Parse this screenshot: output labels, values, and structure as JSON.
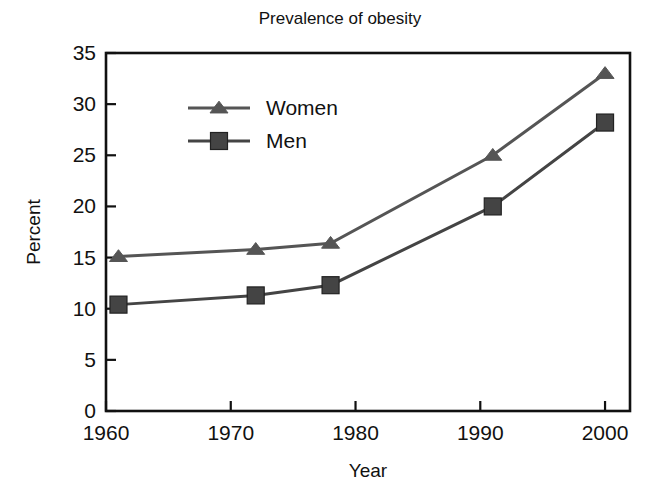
{
  "chart_data": {
    "type": "line",
    "title": "Prevalence of obesity",
    "xlabel": "Year",
    "ylabel": "Percent",
    "xlim": [
      1960,
      2002
    ],
    "ylim": [
      0,
      35
    ],
    "xticks": [
      1960,
      1970,
      1980,
      1990,
      2000
    ],
    "xtick_labels": [
      "1960",
      "1970",
      "1980",
      "1990",
      "2000"
    ],
    "yticks": [
      0,
      5,
      10,
      15,
      20,
      25,
      30,
      35
    ],
    "ytick_labels": [
      "0",
      "5",
      "10",
      "15",
      "20",
      "25",
      "30",
      "35"
    ],
    "grid": false,
    "legend_position": "upper left inside",
    "series": [
      {
        "name": "Women",
        "marker": "triangle",
        "color": "#555555",
        "x": [
          1961,
          1972,
          1978,
          1991,
          2000
        ],
        "values": [
          15.1,
          15.8,
          16.4,
          25.0,
          33.0
        ]
      },
      {
        "name": "Men",
        "marker": "square",
        "color": "#444444",
        "x": [
          1961,
          1972,
          1978,
          1991,
          2000
        ],
        "values": [
          10.4,
          11.3,
          12.3,
          20.0,
          28.2
        ]
      }
    ]
  },
  "colors": {
    "background": "#ffffff",
    "axis": "#111111",
    "text": "#111111",
    "women_series": "#555555",
    "men_series": "#444444"
  },
  "legend": {
    "items": [
      {
        "label": "Women",
        "marker": "triangle-marker"
      },
      {
        "label": "Men",
        "marker": "square-marker"
      }
    ]
  }
}
